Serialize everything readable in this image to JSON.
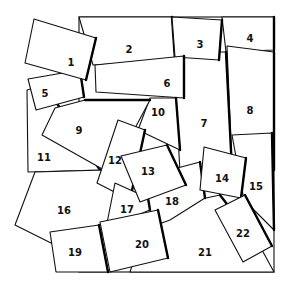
{
  "diagram": {
    "type": "overlapping-numbered-squares",
    "frame": {
      "x": 79,
      "y": 17,
      "width": 51,
      "height": 110,
      "note": "frame spans from x≈79 to x≈274, y≈17 to y≈272"
    },
    "colors": {
      "fill": "#ffffff",
      "stroke": "#111111",
      "background": "#ffffff"
    },
    "pieces": [
      {
        "id": "4",
        "label": "4",
        "points": "222,17 274,17 274,50 226,52",
        "lx": 250,
        "ly": 38
      },
      {
        "id": "8",
        "label": "8",
        "points": "227,46 274,52 274,170 232,170",
        "lx": 250,
        "ly": 110
      },
      {
        "id": "7",
        "label": "7",
        "points": "176,52 226,52 232,170 180,172 176,100",
        "lx": 204,
        "ly": 123
      },
      {
        "id": "15",
        "label": "15",
        "points": "232,135 272,133 274,230 244,200",
        "lx": 256,
        "ly": 186
      },
      {
        "id": "21",
        "label": "21",
        "points": "150,210 220,195 262,250 274,272 130,272",
        "lx": 205,
        "ly": 252
      },
      {
        "id": "18",
        "label": "18",
        "points": "140,178 200,162 205,198 170,220 148,228",
        "lx": 172,
        "ly": 201
      },
      {
        "id": "2",
        "label": "2",
        "points": "79,17 172,17 175,60 93,65",
        "lx": 129,
        "ly": 49
      },
      {
        "id": "3",
        "label": "3",
        "points": "172,17 222,20 219,60 175,57",
        "lx": 200,
        "ly": 44
      },
      {
        "id": "6",
        "label": "6",
        "points": "95,65 184,56 184,98 96,92",
        "lx": 167,
        "ly": 83
      },
      {
        "id": "10",
        "label": "10",
        "points": "150,98 176,98 180,150 138,130",
        "lx": 158,
        "ly": 112
      },
      {
        "id": "11",
        "label": "11",
        "points": "27,90 45,85 100,170 28,172",
        "lx": 44,
        "ly": 157
      },
      {
        "id": "9",
        "label": "9",
        "points": "55,108 85,100 150,100 126,145 104,170 42,135",
        "lx": 79,
        "ly": 130
      },
      {
        "id": "5",
        "label": "5",
        "points": "28,79 80,70 84,97 36,110",
        "lx": 45,
        "ly": 93
      },
      {
        "id": "1",
        "label": "1",
        "points": "34,19 96,38 86,80 25,63",
        "lx": 71,
        "ly": 62
      },
      {
        "id": "16",
        "label": "16",
        "points": "35,172 105,170 125,188 110,230 55,245 15,225",
        "lx": 64,
        "ly": 210
      },
      {
        "id": "12",
        "label": "12",
        "points": "118,120 145,130 130,200 97,183",
        "lx": 115,
        "ly": 160
      },
      {
        "id": "17",
        "label": "17",
        "points": "115,183 148,198 150,210 106,228",
        "lx": 127,
        "ly": 209
      },
      {
        "id": "13",
        "label": "13",
        "points": "121,156 167,145 186,185 140,202",
        "lx": 148,
        "ly": 171
      },
      {
        "id": "14",
        "label": "14",
        "points": "204,147 246,158 241,198 200,190",
        "lx": 222,
        "ly": 178
      },
      {
        "id": "22",
        "label": "22",
        "points": "215,210 245,195 272,246 243,262",
        "lx": 243,
        "ly": 233
      },
      {
        "id": "19",
        "label": "19",
        "points": "50,232 99,225 108,272 56,272",
        "lx": 75,
        "ly": 252
      },
      {
        "id": "20",
        "label": "20",
        "points": "100,222 158,210 168,258 110,272",
        "lx": 142,
        "ly": 244
      }
    ]
  }
}
